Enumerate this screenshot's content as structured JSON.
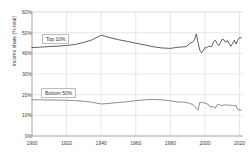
{
  "chart_data": {
    "type": "line",
    "title": "",
    "xlabel": "",
    "ylabel": "Income share (% total)",
    "xlim": [
      1900,
      2022
    ],
    "ylim": [
      0,
      60
    ],
    "xticks": [
      "1900",
      "1920",
      "1940",
      "1960",
      "1980",
      "2000",
      "2020"
    ],
    "xtick_values": [
      1900,
      1920,
      1940,
      1960,
      1980,
      2000,
      2020
    ],
    "yticks": [
      "0%",
      "10%",
      "20%",
      "30%",
      "40%",
      "50%",
      "60%"
    ],
    "ytick_values": [
      0,
      10,
      20,
      30,
      40,
      50,
      60
    ],
    "grid": true,
    "legend_position": "inline-labels",
    "series": [
      {
        "name": "Top 10%",
        "color": "#4d4d4d",
        "x": [
          1900,
          1905,
          1910,
          1915,
          1920,
          1925,
          1930,
          1935,
          1940,
          1945,
          1950,
          1955,
          1960,
          1965,
          1970,
          1975,
          1980,
          1983,
          1985,
          1987,
          1989,
          1991,
          1993,
          1994,
          1995,
          1996,
          1997,
          1998,
          1999,
          2000,
          2001,
          2002,
          2003,
          2004,
          2005,
          2006,
          2007,
          2008,
          2009,
          2010,
          2011,
          2012,
          2013,
          2014,
          2015,
          2016,
          2017,
          2018,
          2019,
          2020,
          2021
        ],
        "values": [
          42.8,
          43.0,
          43.3,
          43.5,
          43.8,
          44.3,
          45.3,
          46.6,
          48.8,
          47.6,
          46.6,
          45.8,
          44.9,
          44.1,
          43.2,
          42.6,
          42.4,
          42.8,
          43.0,
          43.1,
          43.2,
          44.6,
          45.6,
          46.6,
          49.4,
          45.2,
          41.6,
          40.3,
          41.2,
          42.8,
          42.6,
          43.5,
          43.2,
          43.4,
          45.7,
          46.4,
          44.8,
          43.7,
          45.2,
          46.9,
          46.5,
          45.3,
          46.3,
          44.6,
          43.4,
          44.9,
          46.3,
          44.5,
          46.4,
          47.6,
          47.5
        ]
      },
      {
        "name": "Bottom 50%",
        "color": "#808080",
        "x": [
          1900,
          1905,
          1910,
          1915,
          1920,
          1925,
          1930,
          1935,
          1940,
          1945,
          1950,
          1955,
          1960,
          1965,
          1970,
          1975,
          1980,
          1983,
          1985,
          1987,
          1989,
          1991,
          1993,
          1994,
          1995,
          1996,
          1997,
          1998,
          1999,
          2000,
          2001,
          2002,
          2003,
          2004,
          2005,
          2006,
          2007,
          2008,
          2009,
          2010,
          2011,
          2012,
          2013,
          2014,
          2015,
          2016,
          2017,
          2018,
          2019,
          2020,
          2021
        ],
        "values": [
          17.5,
          17.5,
          17.4,
          17.4,
          17.3,
          17.1,
          16.8,
          16.3,
          15.5,
          15.8,
          16.2,
          16.6,
          17.1,
          17.5,
          17.7,
          17.5,
          17.0,
          16.6,
          16.4,
          16.4,
          16.3,
          15.8,
          15.2,
          14.6,
          13.3,
          12.6,
          16.2,
          16.1,
          16.2,
          15.8,
          15.6,
          15.2,
          13.9,
          14.3,
          14.1,
          13.4,
          15.1,
          15.3,
          14.9,
          14.8,
          15.0,
          15.1,
          14.9,
          14.9,
          14.9,
          14.8,
          14.6,
          14.8,
          12.7,
          12.6,
          12.5
        ]
      }
    ],
    "annotations": [
      {
        "name": "Top 10%",
        "label": "Top 10%",
        "x_px": 42,
        "y_px": 34
      },
      {
        "name": "Bottom 50%",
        "label": "Bottom 50%",
        "x_px": 41,
        "y_px": 88
      }
    ],
    "colors": {
      "axis": "#9a9a9a",
      "grid": "#d9d9d9",
      "text": "#404040",
      "background": "#ffffff"
    }
  }
}
